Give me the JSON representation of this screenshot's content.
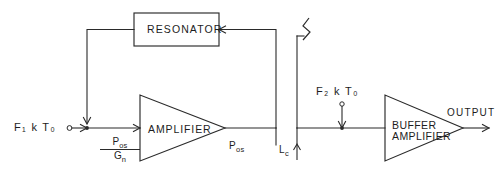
{
  "diagram": {
    "background_color": "#ffffff",
    "line_color": "#2a2a2a",
    "blocks": {
      "resonator": {
        "label": "RESONATOR",
        "shape": "rectangle"
      },
      "amplifier": {
        "label": "AMPLIFIER",
        "shape": "triangle"
      },
      "buffer_amplifier": {
        "label_line1": "BUFFER",
        "label_line2": "AMPLIFIER",
        "shape": "triangle"
      }
    },
    "labels": {
      "input_noise_1": {
        "base": "F",
        "sub1": "1",
        "mid": "k",
        "base2": "T",
        "sub2": "o"
      },
      "input_noise_1_text": "F₁ k T₀",
      "input_noise_2_text": "F₂ k T₀",
      "fraction_numerator": "P",
      "fraction_numerator_sub": "os",
      "fraction_denominator": "G",
      "fraction_denominator_sub": "n",
      "power_osc": "P",
      "power_osc_sub": "os",
      "coupling_loss": "L",
      "coupling_loss_sub": "c",
      "output": "OUTPUT"
    },
    "symbols": {
      "break_symbol": "zigzag-break-icon",
      "summing_junction_1": "summing-junction-icon",
      "summing_junction_2": "summing-junction-icon",
      "input_terminal": "open-terminal-node-icon",
      "feedback_direction": "arrow-left",
      "signal_direction": "arrow-right"
    }
  }
}
